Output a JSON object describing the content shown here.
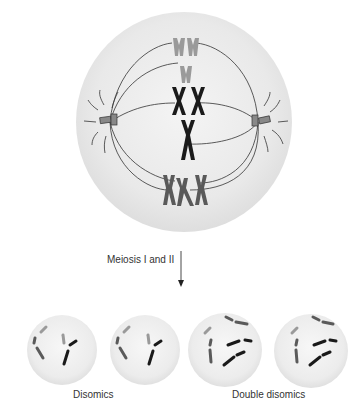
{
  "figure": {
    "process_label": "Meiosis I and II",
    "groups": [
      {
        "label": "Disomics",
        "cells": 2
      },
      {
        "label": "Double disomics",
        "cells": 2
      }
    ],
    "colors": {
      "cell_fill": "#ebebeb",
      "cell_edge": "#d8d8d8",
      "chromosome_dark": "#1a1a1a",
      "chromosome_mid": "#5a5a5a",
      "chromosome_light": "#9a9a9a",
      "spindle": "#333333",
      "background": "#ffffff"
    },
    "parent_cell": {
      "stage": "metaphase I",
      "spindle_poles": 2,
      "chromosome_rows": [
        {
          "shade": "light",
          "count": 2
        },
        {
          "shade": "light",
          "count": 1
        },
        {
          "shade": "dark",
          "count": 2
        },
        {
          "shade": "dark",
          "count": 1
        },
        {
          "shade": "mid",
          "count": 3
        }
      ]
    }
  }
}
